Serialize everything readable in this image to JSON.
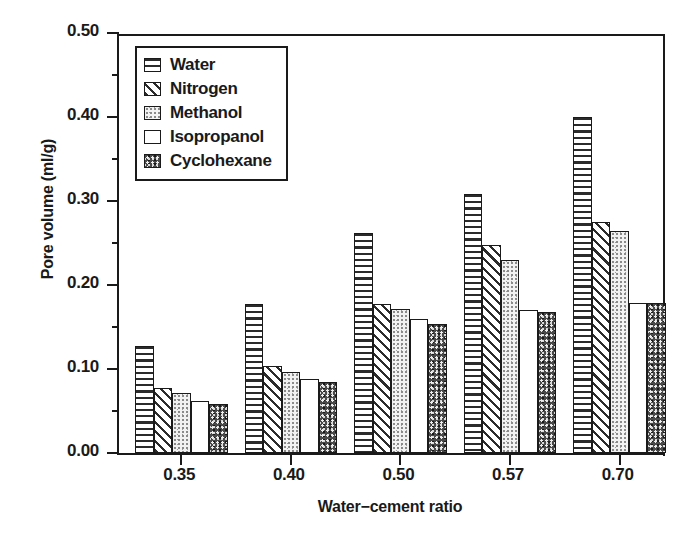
{
  "chart_data": {
    "type": "bar",
    "title": "",
    "xlabel": "Water−cement ratio",
    "ylabel": "Pore volume (ml/g)",
    "categories": [
      "0.35",
      "0.40",
      "0.50",
      "0.57",
      "0.70"
    ],
    "series": [
      {
        "name": "Water",
        "pattern": "horizontal-stripes",
        "values": [
          0.127,
          0.177,
          0.262,
          0.308,
          0.4
        ]
      },
      {
        "name": "Nitrogen",
        "pattern": "diagonal-hatch",
        "values": [
          0.077,
          0.104,
          0.177,
          0.248,
          0.275
        ]
      },
      {
        "name": "Methanol",
        "pattern": "light-speckle",
        "values": [
          0.072,
          0.096,
          0.172,
          0.23,
          0.264
        ]
      },
      {
        "name": "Isopropanol",
        "pattern": "solid-white",
        "values": [
          0.062,
          0.088,
          0.159,
          0.17,
          0.178
        ]
      },
      {
        "name": "Cyclohexane",
        "pattern": "dark-speckle",
        "values": [
          0.058,
          0.084,
          0.154,
          0.168,
          0.178
        ]
      }
    ],
    "ylim": [
      0.0,
      0.5
    ],
    "yticks": [
      "0.00",
      "0.10",
      "0.20",
      "0.30",
      "0.40",
      "0.50"
    ],
    "ytick_values": [
      0.0,
      0.1,
      0.2,
      0.3,
      0.4,
      0.5
    ],
    "yminor_values": [
      0.05,
      0.15,
      0.25,
      0.35,
      0.45
    ],
    "grid": false,
    "legend_position": "upper-left-inside"
  },
  "legend": {
    "entries": [
      {
        "label": "Water"
      },
      {
        "label": "Nitrogen"
      },
      {
        "label": "Methanol"
      },
      {
        "label": "Isopropanol"
      },
      {
        "label": "Cyclohexane"
      }
    ]
  },
  "axes": {
    "y_title": "Pore volume (ml/g)",
    "x_title": "Water−cement ratio"
  },
  "colors": {
    "ink": "#1a1a1a",
    "background": "#ffffff",
    "speckle_dark": "#4a4a4a",
    "speckle_light": "#f2f2f2"
  }
}
